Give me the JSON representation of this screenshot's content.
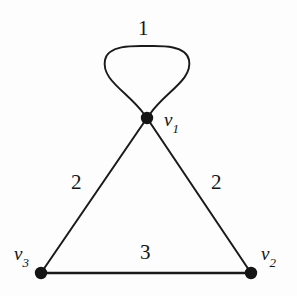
{
  "figure": {
    "type": "weighted-multigraph-diagram",
    "background_color": "#fdfdfd",
    "ink_color": "#141414"
  },
  "vertices": [
    {
      "id": "v1",
      "label": "v",
      "subscript": "1",
      "x": 147,
      "y": 118,
      "radius": 6
    },
    {
      "id": "v2",
      "label": "v",
      "subscript": "2",
      "x": 251,
      "y": 273,
      "radius": 6
    },
    {
      "id": "v3",
      "label": "v",
      "subscript": "3",
      "x": 41,
      "y": 273,
      "radius": 6
    }
  ],
  "edges": [
    {
      "id": "loop-v1-v1",
      "from": "v1",
      "to": "v1",
      "weight": "1",
      "kind": "self-loop"
    },
    {
      "id": "edge-v1-v3",
      "from": "v1",
      "to": "v3",
      "weight": "2",
      "kind": "straight"
    },
    {
      "id": "edge-v1-v2",
      "from": "v1",
      "to": "v2",
      "weight": "2",
      "kind": "straight"
    },
    {
      "id": "edge-v3-v2",
      "from": "v3",
      "to": "v2",
      "weight": "3",
      "kind": "straight"
    }
  ],
  "labels": {
    "weight_loop": "1",
    "weight_left": "2",
    "weight_right": "2",
    "weight_bottom": "3",
    "v1_base": "v",
    "v1_sub": "1",
    "v2_base": "v",
    "v2_sub": "2",
    "v3_base": "v",
    "v3_sub": "3"
  }
}
